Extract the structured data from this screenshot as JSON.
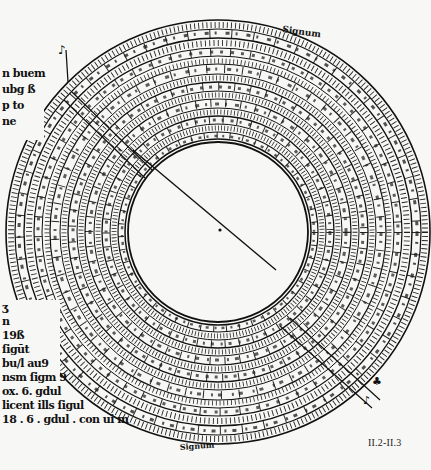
{
  "figure": {
    "caption": "II.2-II.3"
  },
  "left_margin_text_top": [
    "n buem",
    "ubg ß",
    "p to",
    "ne"
  ],
  "left_margin_text_bottom": [
    "ʒ",
    "n",
    "19ß",
    "ſigūt",
    "bu/l au9",
    "nsm ſigm 9",
    "ox. 6. gdul",
    "licent ills ſigul",
    "18 . 6 . gdul . con ui m"
  ],
  "ring_labels": {
    "top": [
      "14",
      "15",
      "20",
      "25",
      "20",
      "10",
      "15"
    ],
    "top_caption": "Signum",
    "bottom": [
      "20",
      "30",
      "10",
      "30",
      "20"
    ],
    "bottom_caption": "Signum"
  },
  "colors": {
    "paper": "#f7f7f5",
    "ink": "#111111"
  }
}
